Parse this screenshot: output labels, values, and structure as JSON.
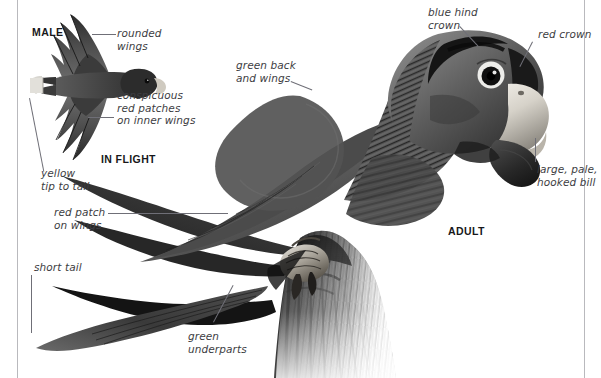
{
  "plate": {
    "species_common_name_visible": false,
    "background_color": "#ffffff",
    "text_color": "#3d3d42",
    "rule_color": "#b9b9bd"
  },
  "headings": {
    "male": "MALE",
    "in_flight": "IN FLIGHT",
    "adult": "ADULT"
  },
  "annotations": [
    {
      "id": "rounded-wings",
      "text": "rounded\nwings",
      "align": "left"
    },
    {
      "id": "conspicuous-red",
      "text": "conspicuous\nred patches\non inner wings",
      "align": "left"
    },
    {
      "id": "yellow-tip-to-tail",
      "text": "yellow\ntip to tail",
      "align": "left"
    },
    {
      "id": "red-patch-on-wings",
      "text": "red patch\non wings",
      "align": "left"
    },
    {
      "id": "short-tail",
      "text": "short tail",
      "align": "left"
    },
    {
      "id": "green-underparts",
      "text": "green\nunderparts",
      "align": "left"
    },
    {
      "id": "green-back-wings",
      "text": "green back\nand wings",
      "align": "left"
    },
    {
      "id": "blue-hind-crown",
      "text": "blue hind\ncrown",
      "align": "left"
    },
    {
      "id": "red-crown",
      "text": "red crown",
      "align": "left"
    },
    {
      "id": "large-pale-bill",
      "text": "large, pale,\nhooked bill",
      "align": "left"
    }
  ],
  "figures": {
    "flight_silhouette": {
      "name": "parrot-in-flight-underside",
      "description": "dark parrot seen from below with spread rounded wings and pale-tipped short tail"
    },
    "perched_adult": {
      "name": "perched-adult-parrot-photo",
      "description": "large dark parrot perched on a gnarled branch, head turned to the right, pale hooked bill"
    }
  }
}
